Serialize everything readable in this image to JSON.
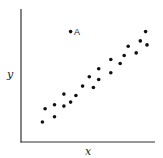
{
  "chart_data": {
    "type": "scatter",
    "title": "",
    "xlabel": "x",
    "ylabel": "y",
    "xlim": [
      0,
      10
    ],
    "ylim": [
      0,
      10
    ],
    "grid": false,
    "legend": null,
    "ticks": {
      "x": [],
      "y": []
    },
    "series": [
      {
        "name": "data",
        "points": [
          {
            "x": 1.6,
            "y": 1.5
          },
          {
            "x": 1.8,
            "y": 2.5
          },
          {
            "x": 2.5,
            "y": 1.9
          },
          {
            "x": 2.5,
            "y": 2.8
          },
          {
            "x": 3.2,
            "y": 2.7
          },
          {
            "x": 3.7,
            "y": 3.0
          },
          {
            "x": 3.2,
            "y": 3.6
          },
          {
            "x": 4.1,
            "y": 3.5
          },
          {
            "x": 4.6,
            "y": 4.2
          },
          {
            "x": 5.4,
            "y": 4.1
          },
          {
            "x": 5.1,
            "y": 4.9
          },
          {
            "x": 5.8,
            "y": 4.7
          },
          {
            "x": 5.8,
            "y": 5.5
          },
          {
            "x": 6.7,
            "y": 5.2
          },
          {
            "x": 6.7,
            "y": 6.2
          },
          {
            "x": 7.4,
            "y": 5.9
          },
          {
            "x": 7.7,
            "y": 6.5
          },
          {
            "x": 8.6,
            "y": 6.7
          },
          {
            "x": 8.0,
            "y": 7.2
          },
          {
            "x": 9.4,
            "y": 7.3
          },
          {
            "x": 8.9,
            "y": 7.6
          },
          {
            "x": 9.3,
            "y": 8.3
          }
        ]
      },
      {
        "name": "outlier",
        "points": [
          {
            "x": 3.7,
            "y": 8.3,
            "label": "A"
          }
        ]
      }
    ],
    "annotations": [
      {
        "text": "A",
        "x": 3.7,
        "y": 8.3
      }
    ]
  },
  "style": {
    "axis_color": "#333333",
    "point_color": "#111111",
    "background": "#ffffff"
  }
}
